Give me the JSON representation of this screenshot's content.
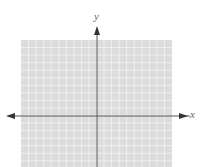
{
  "diagram": {
    "type": "coordinate-plane",
    "x_axis_label": "x",
    "y_axis_label": "y",
    "grid": {
      "columns": 20,
      "rows": 17,
      "left": 21,
      "top": 40,
      "right": 172,
      "bottom": 167,
      "fill": "#dcdcdc",
      "line_color": "#f4f4f4"
    },
    "axis_color": "#555555",
    "origin": {
      "x": 97,
      "y": 116
    }
  }
}
